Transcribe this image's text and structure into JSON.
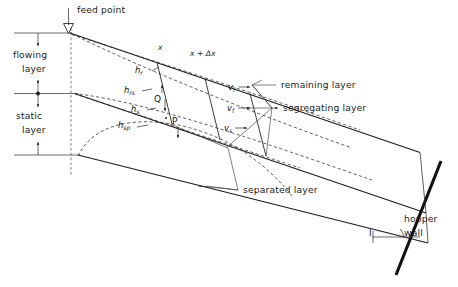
{
  "figure": {
    "type": "technical-diagram",
    "background_color": "#ffffff",
    "line_color": "#1a1a1a"
  },
  "annotations": {
    "feed_point": "feed point",
    "flowing_layer_line1": "flowing",
    "flowing_layer_line2": "layer",
    "static_layer_line1": "static",
    "static_layer_line2": "layer",
    "remaining_layer": "remaining layer",
    "segregating_layer": "segregating layer",
    "separated_layer": "separated layer",
    "hopper_wall_line1": "hopper",
    "hopper_wall_line2": "wall",
    "angle_label": "I"
  },
  "coordinates": {
    "x": "x",
    "x_plus_dx": "x + Δx"
  },
  "thicknesses": [
    {
      "base": "h",
      "sub": "r",
      "meaning": "remaining layer thickness"
    },
    {
      "base": "h",
      "sub": "rs",
      "meaning": "remaining-segregating interface"
    },
    {
      "base": "h",
      "sub": "s",
      "meaning": "segregating layer thickness"
    },
    {
      "base": "h",
      "sub": "sp",
      "meaning": "separated layer thickness"
    }
  ],
  "velocities": [
    {
      "base": "v",
      "sub": "r",
      "arrow": "→",
      "meaning": "remaining layer velocity"
    },
    {
      "base": "v",
      "sub": "f",
      "arrow": "→",
      "meaning": "flowing layer velocity"
    },
    {
      "base": "v",
      "sub": "s",
      "arrow": "→",
      "meaning": "segregating layer velocity"
    }
  ],
  "flux_points": [
    {
      "label": "Q",
      "meaning": "flux across remaining-segregating boundary"
    },
    {
      "label": "P",
      "meaning": "flux across segregating-separated boundary"
    }
  ]
}
